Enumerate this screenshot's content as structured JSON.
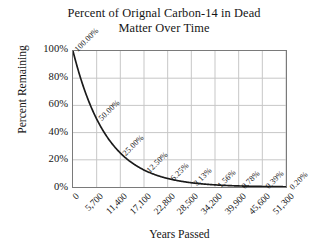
{
  "chart_data": {
    "type": "line",
    "title": "Percent of Orignal Carbon-14 in Dead Matter Over Time",
    "title_lines": [
      "Percent of Orignal Carbon-14 in Dead",
      "Matter Over Time"
    ],
    "xlabel": "Years Passed",
    "ylabel": "Percent Remaining",
    "categories": [
      "0",
      "5,700",
      "11,400",
      "17,100",
      "22,800",
      "28,500",
      "34,200",
      "39,900",
      "45,600",
      "51,300"
    ],
    "x": [
      0,
      5700,
      11400,
      17100,
      22800,
      28500,
      34200,
      39900,
      45600,
      51300
    ],
    "values": [
      100.0,
      50.0,
      25.0,
      12.5,
      6.25,
      3.13,
      1.56,
      0.78,
      0.39,
      0.2
    ],
    "point_labels": [
      "100.00%",
      "50.00%",
      "25.00%",
      "12.50%",
      "6.25%",
      "3.13%",
      "1.56%",
      "0.78%",
      "0.39%",
      "0.20%"
    ],
    "ylim": [
      0,
      100
    ],
    "xlim": [
      0,
      51300
    ],
    "yticks": [
      0,
      20,
      40,
      60,
      80,
      100
    ],
    "ytick_labels": [
      "0%",
      "20%",
      "40%",
      "60%",
      "80%",
      "100%"
    ],
    "grid": true,
    "legend": false,
    "legend_position": "none",
    "series_color": "#1a1a1a",
    "grid_color": "#c6c6c6",
    "plot_border_color": "#7a7a7a",
    "background_color": "#ffffff"
  }
}
